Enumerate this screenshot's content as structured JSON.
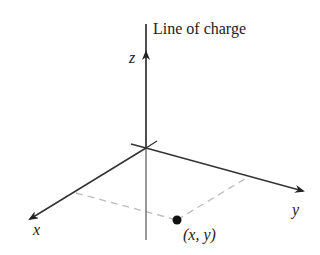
{
  "diagram": {
    "title_label": "Line of charge",
    "axes": {
      "x": "x",
      "y": "y",
      "z": "z"
    },
    "point_label": "(x, y)",
    "colors": {
      "axis": "#333333",
      "dashed": "#bbbbbb",
      "below_origin": "#777777",
      "point": "#111111"
    }
  }
}
